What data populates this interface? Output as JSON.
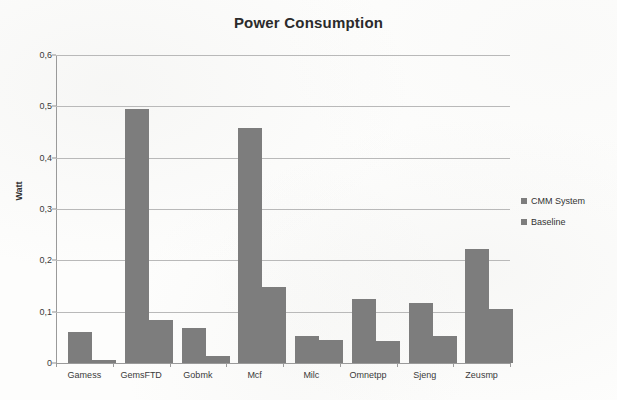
{
  "chart_data": {
    "type": "bar",
    "title": "Power Consumption",
    "xlabel": "",
    "ylabel": "Watt",
    "ylim": [
      0,
      0.6
    ],
    "ytick_labels": [
      "0,6",
      "0,5",
      "0,4",
      "0,3",
      "0,2",
      "0,1",
      "0"
    ],
    "ytick_values": [
      0.6,
      0.5,
      0.4,
      0.3,
      0.2,
      0.1,
      0
    ],
    "grid": true,
    "legend_position": "right",
    "categories": [
      "Gamess",
      "GemsFTD",
      "Gobmk",
      "Mcf",
      "Milc",
      "Omnetpp",
      "Sjeng",
      "Zeusmp"
    ],
    "series": [
      {
        "name": "CMM System",
        "color": "#7d7d7d",
        "values": [
          0.06,
          0.495,
          0.068,
          0.457,
          0.053,
          0.125,
          0.117,
          0.223
        ]
      },
      {
        "name": "Baseline",
        "color": "#7d7d7d",
        "values": [
          0.005,
          0.083,
          0.013,
          0.148,
          0.045,
          0.042,
          0.053,
          0.105
        ]
      }
    ]
  },
  "colors": {
    "bar": "#7d7d7d",
    "gridline": "#b9b9b9",
    "axis": "#9a9a9a",
    "text": "#333333",
    "background": "#fdfdfc"
  }
}
